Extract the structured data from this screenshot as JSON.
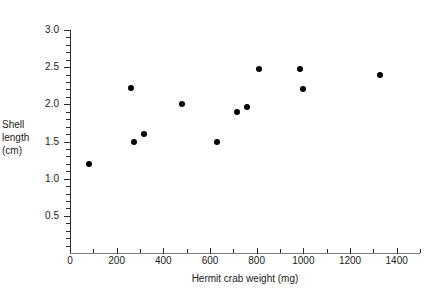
{
  "chart_data": {
    "type": "scatter",
    "title": "",
    "xlabel": "Hermit crab weight (mg)",
    "ylabel": "Shell length (cm)",
    "ylabel_lines": [
      "Shell",
      "length",
      "(cm)"
    ],
    "xlim": [
      0,
      1500
    ],
    "ylim": [
      0,
      3.0
    ],
    "grid": false,
    "legend": "none",
    "x_major_ticks": [
      0,
      200,
      400,
      600,
      800,
      1000,
      1200,
      1400
    ],
    "x_tick_labels": [
      "0",
      "200",
      "400",
      "600",
      "800",
      "1000",
      "1200",
      "1400"
    ],
    "x_minor_tick_interval": 100,
    "y_major_ticks": [
      0.5,
      1.0,
      1.5,
      2.0,
      2.5,
      3.0
    ],
    "y_tick_labels": [
      "0.5",
      "1.0",
      "1.5",
      "2.0",
      "2.5",
      "3.0"
    ],
    "y_minor_tick_interval": 0.1,
    "marker": "filled-circle",
    "marker_color": "#000000",
    "points": [
      {
        "x": 80,
        "y": 1.2
      },
      {
        "x": 262,
        "y": 2.22
      },
      {
        "x": 275,
        "y": 1.5
      },
      {
        "x": 318,
        "y": 1.6
      },
      {
        "x": 482,
        "y": 2.0
      },
      {
        "x": 628,
        "y": 1.5
      },
      {
        "x": 714,
        "y": 1.9
      },
      {
        "x": 758,
        "y": 1.96
      },
      {
        "x": 808,
        "y": 2.48
      },
      {
        "x": 985,
        "y": 2.47
      },
      {
        "x": 998,
        "y": 2.2
      },
      {
        "x": 1330,
        "y": 2.4
      }
    ]
  },
  "caption": ""
}
